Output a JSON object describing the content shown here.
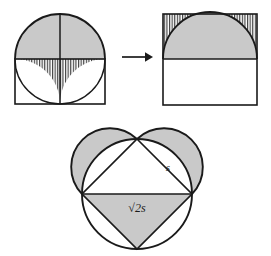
{
  "figure": {
    "background_color": "#ffffff",
    "stroke_color": "#1a1a1a",
    "shade_color": "#c9c9c9",
    "hatch_color": "#303030",
    "panels": [
      {
        "id": "left-panel",
        "name": "square-with-semicircle-and-quarter-arcs",
        "description": "Unit square with a semicircle erected on its top edge (shaded) and two quarter circles inside the square whose interior region is hatched",
        "square": {
          "x": 15,
          "y": 59,
          "width": 90,
          "height": 45
        },
        "semicircle": {
          "cx": 60,
          "cy": 59,
          "r": 45,
          "shaded": true
        },
        "vertical_diameter": {
          "x": 60,
          "y1": 14,
          "y2": 104
        },
        "quarter_arcs": [
          {
            "center_x": 15,
            "center_y": 104,
            "r": 45
          },
          {
            "center_x": 105,
            "center_y": 104,
            "r": 45
          }
        ],
        "hatched_region": "between the two quarter arcs, under the top edge of the square"
      },
      {
        "id": "arrow",
        "name": "transformation-arrow",
        "glyph": "→",
        "x": 120,
        "y": 55
      },
      {
        "id": "right-panel",
        "name": "square-with-inscribed-semicircle",
        "description": "Same square with the semicircle inscribed in its upper half; the corner regions are hatched",
        "square": {
          "x": 163,
          "y": 14,
          "width": 94,
          "height": 91
        },
        "midline_y": 59,
        "semicircle": {
          "cx": 210,
          "cy": 59,
          "r": 47,
          "shaded": true
        },
        "hatched_region": "upper-left and upper-right corners between the square and the semicircle"
      },
      {
        "id": "bottom-panel",
        "name": "heart-lune-figure",
        "description": "Circle of radius r with an inscribed square; semicircles on the two upper sides form lunes (shaded); the lower half-square triangle is shaded",
        "circle": {
          "cx": 137,
          "cy": 194,
          "r": 55
        },
        "inscribed_square_vertices": [
          {
            "x": 137,
            "y": 139,
            "name": "top"
          },
          {
            "x": 192,
            "y": 194,
            "name": "right"
          },
          {
            "x": 137,
            "y": 249,
            "name": "bottom"
          },
          {
            "x": 82,
            "y": 194,
            "name": "left"
          }
        ],
        "lunes": [
          {
            "name": "upper-left-lune",
            "chord_from": "left",
            "chord_to": "top",
            "shaded": true
          },
          {
            "name": "upper-right-lune",
            "chord_from": "top",
            "chord_to": "right",
            "shaded": true
          }
        ],
        "shaded_triangle": {
          "name": "lower-triangle",
          "vertices": [
            "left",
            "right",
            "bottom"
          ],
          "shaded": true
        },
        "labels": [
          {
            "id": "side-label",
            "text": "s",
            "x": 168,
            "y": 168,
            "describes": "side of inscribed square"
          },
          {
            "id": "diagonal-label",
            "text": "√2s",
            "x": 137,
            "y": 208,
            "describes": "diagonal of inscribed square"
          }
        ]
      }
    ],
    "labels": {
      "s": "s",
      "sqrt2s": "√2s",
      "arrow": "→"
    }
  }
}
